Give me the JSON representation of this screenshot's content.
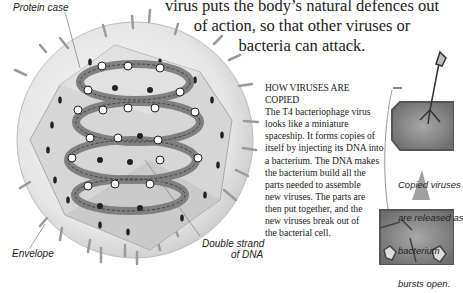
{
  "intro": {
    "line1": "virus puts the body’s natural defences out",
    "line2": "of action, so that other viruses or",
    "line3": "bacteria can attack."
  },
  "diagram": {
    "labels": {
      "protein_case": "Protein case",
      "envelope": "Envelope",
      "dna_line1": "Double strand",
      "dna_line2": "of DNA"
    }
  },
  "section": {
    "heading": "HOW VIRUSES ARE COPIED",
    "lines": [
      "The T4 bacteriophage virus",
      "looks like a miniature",
      "spaceship. It forms copies of",
      "itself by injecting its DNA into",
      "a bacterium. The DNA makes",
      "the bacterium build all the",
      "parts needed to assemble",
      "new viruses. The parts are",
      "then put together, and the",
      "new viruses break out of",
      "the bacterial cell."
    ]
  },
  "side_panel": {
    "caption_lines": [
      "Copied viruses",
      "are released as",
      "bacterium",
      "bursts open."
    ]
  },
  "colors": {
    "envelope": "#e9e9e9",
    "case": "#d2d2d2",
    "dna": "#7c7c7c",
    "bacterium": "#8e8e8e"
  }
}
